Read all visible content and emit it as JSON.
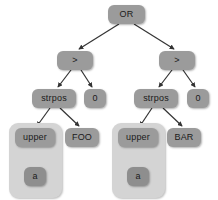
{
  "diagram": {
    "colors": {
      "node_fill": "#9b9b9b",
      "node_fill_dark": "#8e8e8e",
      "group_fill": "#d4d4d4",
      "edge": "#333333",
      "background": "#ffffff",
      "text": "#1a1a1a"
    },
    "nodes": [
      {
        "id": "or",
        "label": "OR",
        "x": 108,
        "y": 5,
        "w": 37,
        "h": 19,
        "shade": "normal"
      },
      {
        "id": "gt-left",
        "label": ">",
        "x": 57,
        "y": 51,
        "w": 36,
        "h": 19,
        "shade": "normal"
      },
      {
        "id": "gt-right",
        "label": ">",
        "x": 159,
        "y": 51,
        "w": 36,
        "h": 19,
        "shade": "normal"
      },
      {
        "id": "strpos-left",
        "label": "strpos",
        "x": 32,
        "y": 89,
        "w": 44,
        "h": 19,
        "shade": "normal"
      },
      {
        "id": "zero-left",
        "label": "0",
        "x": 84,
        "y": 89,
        "w": 22,
        "h": 19,
        "shade": "normal"
      },
      {
        "id": "strpos-right",
        "label": "strpos",
        "x": 134,
        "y": 89,
        "w": 44,
        "h": 19,
        "shade": "normal"
      },
      {
        "id": "zero-right",
        "label": "0",
        "x": 187,
        "y": 89,
        "w": 22,
        "h": 19,
        "shade": "normal"
      },
      {
        "id": "upper-left",
        "label": "upper",
        "x": 15,
        "y": 128,
        "w": 40,
        "h": 19,
        "shade": "normal"
      },
      {
        "id": "foo",
        "label": "FOO",
        "x": 65,
        "y": 128,
        "w": 34,
        "h": 19,
        "shade": "normal"
      },
      {
        "id": "a-left",
        "label": "a",
        "x": 24,
        "y": 167,
        "w": 22,
        "h": 19,
        "shade": "dark"
      },
      {
        "id": "upper-right",
        "label": "upper",
        "x": 118,
        "y": 128,
        "w": 40,
        "h": 19,
        "shade": "normal"
      },
      {
        "id": "bar",
        "label": "BAR",
        "x": 167,
        "y": 128,
        "w": 34,
        "h": 19,
        "shade": "normal"
      },
      {
        "id": "a-right",
        "label": "a",
        "x": 127,
        "y": 167,
        "w": 22,
        "h": 19,
        "shade": "dark"
      }
    ],
    "groups": [
      {
        "id": "group-left",
        "label": "upper-a-subtree-left",
        "x": 9,
        "y": 123,
        "w": 53,
        "h": 75
      },
      {
        "id": "group-right",
        "label": "upper-a-subtree-right",
        "x": 112,
        "y": 123,
        "w": 53,
        "h": 75
      }
    ],
    "edges": [
      {
        "id": "or-to-gt-left",
        "from": "or",
        "to": "gt-left",
        "x1": 119,
        "y1": 24,
        "x2": 79,
        "y2": 49
      },
      {
        "id": "or-to-gt-right",
        "from": "or",
        "to": "gt-right",
        "x1": 134,
        "y1": 24,
        "x2": 174,
        "y2": 49
      },
      {
        "id": "gt-left-to-strpos-left",
        "from": "gt-left",
        "to": "strpos-left",
        "x1": 71,
        "y1": 70,
        "x2": 58,
        "y2": 87
      },
      {
        "id": "gt-left-to-zero-left",
        "from": "gt-left",
        "to": "zero-left",
        "x1": 81,
        "y1": 70,
        "x2": 92,
        "y2": 87
      },
      {
        "id": "gt-right-to-strpos-right",
        "from": "gt-right",
        "to": "strpos-right",
        "x1": 172,
        "y1": 70,
        "x2": 159,
        "y2": 87
      },
      {
        "id": "gt-right-to-zero-right",
        "from": "gt-right",
        "to": "zero-right",
        "x1": 183,
        "y1": 70,
        "x2": 195,
        "y2": 87
      },
      {
        "id": "strpos-left-to-upper",
        "from": "strpos-left",
        "to": "upper-left",
        "x1": 50,
        "y1": 108,
        "x2": 37,
        "y2": 126
      },
      {
        "id": "strpos-left-to-foo",
        "from": "strpos-left",
        "to": "foo",
        "x1": 60,
        "y1": 108,
        "x2": 79,
        "y2": 126
      },
      {
        "id": "upper-left-to-a",
        "from": "upper-left",
        "to": "a-left",
        "x1": 35,
        "y1": 147,
        "x2": 35,
        "y2": 165
      },
      {
        "id": "strpos-right-to-upper",
        "from": "strpos-right",
        "to": "upper-right",
        "x1": 152,
        "y1": 108,
        "x2": 140,
        "y2": 126
      },
      {
        "id": "strpos-right-to-bar",
        "from": "strpos-right",
        "to": "bar",
        "x1": 163,
        "y1": 108,
        "x2": 182,
        "y2": 126
      },
      {
        "id": "upper-right-to-a",
        "from": "upper-right",
        "to": "a-right",
        "x1": 138,
        "y1": 147,
        "x2": 138,
        "y2": 165
      }
    ]
  }
}
